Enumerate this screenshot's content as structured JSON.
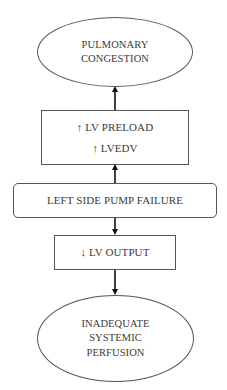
{
  "diagram": {
    "nodes": {
      "pulmonary_congestion": {
        "shape": "ellipse",
        "lines": [
          "PULMONARY",
          "CONGESTION"
        ]
      },
      "lv_preload": {
        "shape": "rectangle",
        "lines": [
          "↑ LV PRELOAD",
          "↑ LVEDV"
        ]
      },
      "left_side_pump_failure": {
        "shape": "rounded-rectangle",
        "lines": [
          "LEFT SIDE PUMP FAILURE"
        ]
      },
      "lv_output": {
        "shape": "rectangle",
        "lines": [
          "↓ LV OUTPUT"
        ]
      },
      "inadequate_systemic_perfusion": {
        "shape": "ellipse",
        "lines": [
          "INADEQUATE",
          "SYSTEMIC",
          "PERFUSION"
        ]
      }
    },
    "edges": [
      {
        "from": "left_side_pump_failure",
        "to": "lv_preload"
      },
      {
        "from": "lv_preload",
        "to": "pulmonary_congestion"
      },
      {
        "from": "left_side_pump_failure",
        "to": "lv_output"
      },
      {
        "from": "lv_output",
        "to": "inadequate_systemic_perfusion"
      }
    ],
    "colors": {
      "stroke": "#555555",
      "text": "#3a3a3a",
      "arrow": "#111111",
      "background": "#ffffff"
    }
  }
}
